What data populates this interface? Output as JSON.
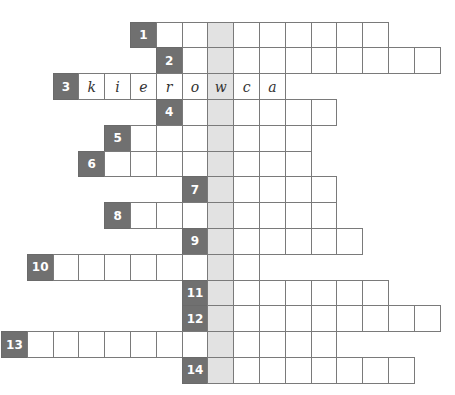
{
  "puzzle": {
    "type": "crossword",
    "highlight_column": 8,
    "colors": {
      "number_cell": "#707070",
      "number_text": "#ffffff",
      "highlight_cell": "#e2e2e2",
      "border": "#7a7a7a",
      "letter_text": "#333333"
    },
    "geometry": {
      "origin_x": 1,
      "origin_y": 21.6,
      "cell_size": 25.8
    },
    "rows": [
      {
        "number": "1",
        "row": 0,
        "start_col": 5,
        "end_col": 14,
        "letters": []
      },
      {
        "number": "2",
        "row": 1,
        "start_col": 6,
        "end_col": 16,
        "letters": []
      },
      {
        "number": "3",
        "row": 2,
        "start_col": 2,
        "end_col": 10,
        "letters": [
          "k",
          "i",
          "e",
          "r",
          "o",
          "w",
          "c",
          "a"
        ]
      },
      {
        "number": "4",
        "row": 3,
        "start_col": 6,
        "end_col": 12,
        "letters": []
      },
      {
        "number": "5",
        "row": 4,
        "start_col": 4,
        "end_col": 11,
        "letters": []
      },
      {
        "number": "6",
        "row": 5,
        "start_col": 3,
        "end_col": 11,
        "letters": []
      },
      {
        "number": "7",
        "row": 6,
        "start_col": 7,
        "end_col": 12,
        "letters": []
      },
      {
        "number": "8",
        "row": 7,
        "start_col": 4,
        "end_col": 12,
        "letters": []
      },
      {
        "number": "9",
        "row": 8,
        "start_col": 7,
        "end_col": 13,
        "letters": []
      },
      {
        "number": "10",
        "row": 9,
        "start_col": 1,
        "end_col": 9,
        "letters": []
      },
      {
        "number": "11",
        "row": 10,
        "start_col": 7,
        "end_col": 14,
        "letters": []
      },
      {
        "number": "12",
        "row": 11,
        "start_col": 7,
        "end_col": 16,
        "letters": []
      },
      {
        "number": "13",
        "row": 12,
        "start_col": 0,
        "end_col": 12,
        "letters": []
      },
      {
        "number": "14",
        "row": 13,
        "start_col": 7,
        "end_col": 15,
        "letters": []
      }
    ]
  }
}
